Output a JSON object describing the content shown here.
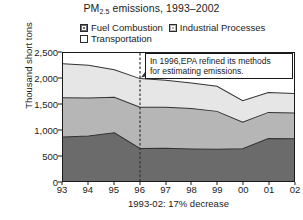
{
  "chart_data": {
    "type": "area",
    "stacked": true,
    "title": "PM2.5 emissions, 1993–2002",
    "title_main": "PM",
    "title_sub": "2.5",
    "title_rest": " emissions, 1993–2002",
    "xlabel": "1993-02: 17%  decrease",
    "ylabel": "Thousand short tons",
    "categories": [
      "93",
      "94",
      "95",
      "96",
      "97",
      "98",
      "99",
      "00",
      "01",
      "02"
    ],
    "x_values": [
      1993,
      1994,
      1995,
      1996,
      1997,
      1998,
      1999,
      2000,
      2001,
      2002
    ],
    "ylim": [
      0,
      2500
    ],
    "yticks": [
      0,
      500,
      1000,
      1500,
      2000,
      2500
    ],
    "ytick_labels": [
      "0",
      "500",
      "1,000",
      "1,500",
      "2,000",
      "2,500"
    ],
    "grid": false,
    "legend_position": "top",
    "series": [
      {
        "name": "Fuel Combustion",
        "color": "#6b6b6b",
        "values": [
          860,
          880,
          940,
          635,
          640,
          625,
          620,
          630,
          830,
          827
        ]
      },
      {
        "name": "Industrial Processes",
        "color": "#b6b6b6",
        "values": [
          765,
          740,
          695,
          807,
          800,
          790,
          740,
          520,
          510,
          503
        ]
      },
      {
        "name": "Transportation",
        "color": "#e6e6e6",
        "values": [
          665,
          640,
          538,
          558,
          530,
          500,
          490,
          420,
          390,
          380
        ]
      }
    ],
    "cumulative_totals": [
      2290,
      2260,
      2173,
      2000,
      1970,
      1915,
      1850,
      1570,
      1730,
      1710
    ],
    "annotation": {
      "line1": "In 1996,EPA refined its methods",
      "line2": "for estimating emissions.",
      "marker_year": "96",
      "marker_style": "dashed-vertical-line-with-arrow"
    }
  }
}
